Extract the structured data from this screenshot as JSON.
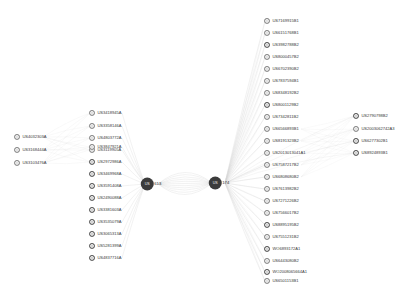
{
  "canvas": {
    "width": 407,
    "height": 286,
    "background": "#ffffff",
    "title": "patent-citation-network"
  },
  "style": {
    "node_color": "#9a9a9a",
    "node_color_dark": "#6d6d6d",
    "hub_color": "#3b3b3b",
    "edge_color": "#d5d5d5",
    "label_color": "#3c3c3c"
  },
  "hubs": [
    {
      "id": "hub-left",
      "inner": "US",
      "outer": "613",
      "x": 151,
      "y": 184
    },
    {
      "id": "hub-right",
      "inner": "US",
      "outer": "174",
      "x": 219,
      "y": 183
    }
  ],
  "left_cluster": {
    "x": 14,
    "marker_x": 14,
    "items": [
      {
        "label": "US4032303A",
        "y": 137,
        "dark": false
      },
      {
        "label": "US3168444A",
        "y": 150,
        "dark": false
      },
      {
        "label": "US3103476A",
        "y": 163,
        "dark": false
      }
    ]
  },
  "mid_left_cluster": {
    "x": 89,
    "items": [
      {
        "label": "US3418945A",
        "y": 113,
        "dark": false
      },
      {
        "label": "US3358146A",
        "y": 126,
        "dark": false
      },
      {
        "label": "US4803772A",
        "y": 138,
        "dark": false
      },
      {
        "label": "US3119905A",
        "y": 150,
        "dark": false
      },
      {
        "label": "US3847921A",
        "y": 147,
        "dark": false
      },
      {
        "label": "US2972986A",
        "y": 162,
        "dark": true
      },
      {
        "label": "US3469968A",
        "y": 174,
        "dark": true
      },
      {
        "label": "US3591408A",
        "y": 186,
        "dark": true
      },
      {
        "label": "US2490088A",
        "y": 198,
        "dark": true
      },
      {
        "label": "US3381603A",
        "y": 210,
        "dark": true
      },
      {
        "label": "US3535079A",
        "y": 222,
        "dark": true
      },
      {
        "label": "US3065313A",
        "y": 234,
        "dark": true
      },
      {
        "label": "US5281399A",
        "y": 246,
        "dark": true
      },
      {
        "label": "US4837716A",
        "y": 258,
        "dark": true
      }
    ]
  },
  "right_cluster": {
    "x": 264,
    "items": [
      {
        "label": "US7169915B1",
        "y": 21,
        "dark": false
      },
      {
        "label": "US6151768B1",
        "y": 33,
        "dark": false
      },
      {
        "label": "US3982788B2",
        "y": 45,
        "dark": true
      },
      {
        "label": "US8000457B2",
        "y": 57,
        "dark": false
      },
      {
        "label": "US6702390B2",
        "y": 69,
        "dark": false
      },
      {
        "label": "US7837594B1",
        "y": 81,
        "dark": false
      },
      {
        "label": "US8348192B2",
        "y": 93,
        "dark": false
      },
      {
        "label": "US8001129B2",
        "y": 105,
        "dark": true
      },
      {
        "label": "US7342811B2",
        "y": 117,
        "dark": false
      },
      {
        "label": "US6566893B1",
        "y": 129,
        "dark": false
      },
      {
        "label": "US8191323B2",
        "y": 141,
        "dark": false
      },
      {
        "label": "US2013013041A1",
        "y": 153,
        "dark": false
      },
      {
        "label": "US7587217B2",
        "y": 165,
        "dark": false
      },
      {
        "label": "US6808680B2",
        "y": 177,
        "dark": false
      },
      {
        "label": "US7613982B2",
        "y": 189,
        "dark": false
      },
      {
        "label": "US7271226B2",
        "y": 201,
        "dark": false
      },
      {
        "label": "US7566017B2",
        "y": 213,
        "dark": false
      },
      {
        "label": "US8895195B2",
        "y": 225,
        "dark": true
      },
      {
        "label": "US7551231B2",
        "y": 237,
        "dark": false
      },
      {
        "label": "WO6893172A1",
        "y": 249,
        "dark": true
      },
      {
        "label": "US6443080B2",
        "y": 261,
        "dark": false
      },
      {
        "label": "WO2008065664A1",
        "y": 272,
        "dark": true
      },
      {
        "label": "US6501153B1",
        "y": 281,
        "dark": false
      }
    ]
  },
  "far_right_cluster": {
    "x": 353,
    "items": [
      {
        "label": "US2790798B2",
        "y": 116,
        "dark": true
      },
      {
        "label": "US2003062742A3",
        "y": 129,
        "dark": false
      },
      {
        "label": "US6277302B1",
        "y": 141,
        "dark": true
      },
      {
        "label": "US8924893B1",
        "y": 153,
        "dark": true
      }
    ]
  }
}
